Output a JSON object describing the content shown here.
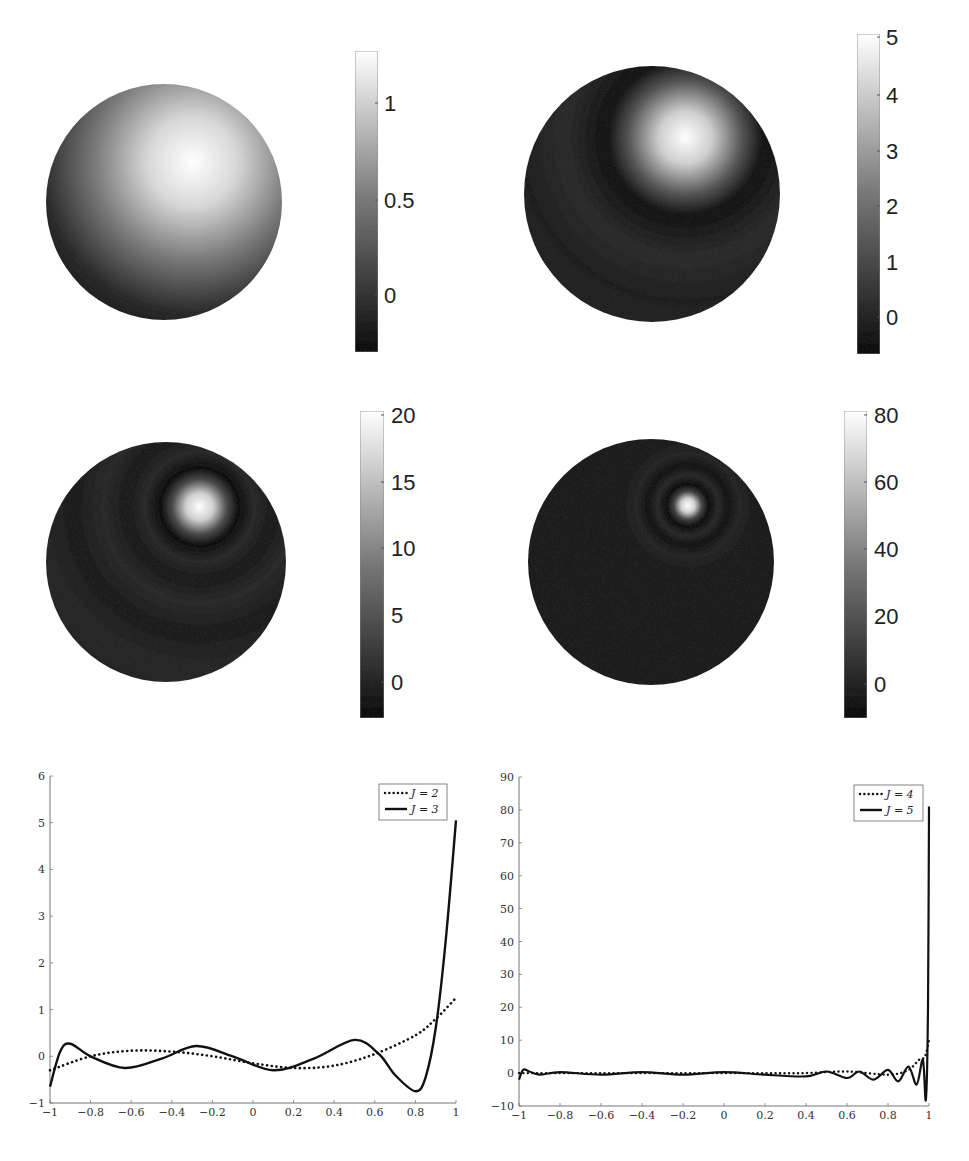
{
  "figure": {
    "panels": [
      {
        "id": "sphere-j2",
        "colorbar_ticks": [
          "1",
          "0.5",
          "0"
        ],
        "colorbar_range": [
          -0.25,
          1.25
        ]
      },
      {
        "id": "sphere-j3",
        "colorbar_ticks": [
          "5",
          "4",
          "3",
          "2",
          "1",
          "0"
        ],
        "colorbar_range": [
          -0.6,
          5.05
        ]
      },
      {
        "id": "sphere-j4",
        "colorbar_ticks": [
          "20",
          "15",
          "10",
          "5",
          "0"
        ],
        "colorbar_range": [
          -2.5,
          20.2
        ]
      },
      {
        "id": "sphere-j5",
        "colorbar_ticks": [
          "80",
          "60",
          "40",
          "20",
          "0"
        ],
        "colorbar_range": [
          -9,
          80.5
        ]
      }
    ]
  },
  "chart_data": [
    {
      "type": "heatmap",
      "title": "",
      "description": "Sphere surface intensity, single broad bright lobe toward upper-right",
      "colorbar": {
        "ticks": [
          1,
          0.5,
          0
        ],
        "range": [
          -0.25,
          1.25
        ],
        "colormap": "gray"
      }
    },
    {
      "type": "heatmap",
      "title": "",
      "description": "Sphere surface intensity, bright lobe upper-right with dark ring",
      "colorbar": {
        "ticks": [
          5,
          4,
          3,
          2,
          1,
          0
        ],
        "range": [
          -0.6,
          5.05
        ],
        "colormap": "gray"
      }
    },
    {
      "type": "heatmap",
      "title": "",
      "description": "Sphere surface intensity, concentrated bright spot with concentric ripples",
      "colorbar": {
        "ticks": [
          20,
          15,
          10,
          5,
          0
        ],
        "range": [
          -2.5,
          20.2
        ],
        "colormap": "gray"
      }
    },
    {
      "type": "heatmap",
      "title": "",
      "description": "Sphere surface intensity, very localized bright spot with faint rings",
      "colorbar": {
        "ticks": [
          80,
          60,
          40,
          20,
          0
        ],
        "range": [
          -9,
          80.5
        ],
        "colormap": "gray"
      }
    },
    {
      "type": "line",
      "title": "",
      "xlabel": "",
      "ylabel": "",
      "xlim": [
        -1,
        1
      ],
      "ylim": [
        -1,
        6
      ],
      "xticks": [
        "−1",
        "−0.8",
        "−0.6",
        "−0.4",
        "−0.2",
        "0",
        "0.2",
        "0.4",
        "0.6",
        "0.8",
        "1"
      ],
      "yticks": [
        "−1",
        "0",
        "1",
        "2",
        "3",
        "4",
        "5",
        "6"
      ],
      "legend_position": "upper right",
      "series": [
        {
          "name": "J = 2",
          "style": "dotted",
          "x": [
            -1,
            -0.8,
            -0.6,
            -0.4,
            -0.2,
            0,
            0.2,
            0.4,
            0.6,
            0.8,
            0.9,
            1
          ],
          "y": [
            -0.3,
            0.0,
            0.12,
            0.1,
            0.0,
            -0.15,
            -0.25,
            -0.2,
            0.05,
            0.45,
            0.8,
            1.25
          ]
        },
        {
          "name": "J = 3",
          "style": "solid",
          "x": [
            -1,
            -0.95,
            -0.9,
            -0.8,
            -0.63,
            -0.45,
            -0.28,
            -0.1,
            0.1,
            0.3,
            0.5,
            0.62,
            0.7,
            0.8,
            0.85,
            0.9,
            0.95,
            1
          ],
          "y": [
            -0.65,
            0.1,
            0.27,
            0.0,
            -0.25,
            -0.05,
            0.22,
            0.0,
            -0.3,
            -0.05,
            0.35,
            0.05,
            -0.4,
            -0.75,
            -0.45,
            0.6,
            2.5,
            5.05
          ]
        }
      ]
    },
    {
      "type": "line",
      "title": "",
      "xlabel": "",
      "ylabel": "",
      "xlim": [
        -1,
        1
      ],
      "ylim": [
        -10,
        90
      ],
      "xticks": [
        "−1",
        "−0.8",
        "−0.6",
        "−0.4",
        "−0.2",
        "0",
        "0.2",
        "0.4",
        "0.6",
        "0.8",
        "1"
      ],
      "yticks": [
        "−10",
        "0",
        "10",
        "20",
        "30",
        "40",
        "50",
        "60",
        "70",
        "80",
        "90"
      ],
      "legend_position": "upper right",
      "series": [
        {
          "name": "J = 4",
          "style": "dotted",
          "x": [
            -1,
            -0.8,
            -0.6,
            -0.4,
            -0.2,
            0,
            0.2,
            0.4,
            0.6,
            0.8,
            0.9,
            0.95,
            0.98,
            1
          ],
          "y": [
            0,
            0,
            0,
            0,
            0,
            0,
            0,
            0,
            0.5,
            -0.5,
            1,
            4,
            5,
            10
          ]
        },
        {
          "name": "J = 5",
          "style": "solid",
          "x": [
            -1,
            -0.98,
            -0.95,
            -0.9,
            -0.8,
            -0.6,
            -0.4,
            -0.2,
            0,
            0.2,
            0.4,
            0.5,
            0.6,
            0.66,
            0.73,
            0.8,
            0.85,
            0.9,
            0.94,
            0.97,
            0.985,
            0.995,
            1
          ],
          "y": [
            -2,
            1,
            0.5,
            -0.5,
            0.3,
            -0.5,
            0.3,
            -0.5,
            0.3,
            -0.5,
            -1,
            0.5,
            -1.5,
            0.5,
            -2,
            1,
            -2.5,
            2,
            -3.5,
            4,
            -8,
            20,
            81
          ]
        }
      ]
    }
  ]
}
